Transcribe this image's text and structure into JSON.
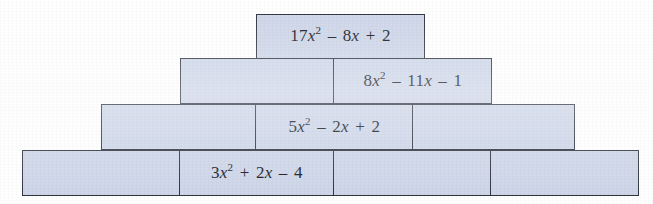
{
  "figure": {
    "name": "polynomial-brick-pyramid",
    "fill_color": "#ccd5e8",
    "border_color": "#2b2f3a",
    "background_color": "#ffffff"
  },
  "rows": [
    {
      "id": "row-1",
      "bricks": [
        {
          "id": "brick-1-1",
          "filled": true,
          "expr_html": "17<span class=\"var\">x</span><sup>2</sup><span class=\"op\"> – </span>8<span class=\"var\">x</span><span class=\"op\"> + </span>2",
          "expr_text": "17x2 – 8x + 2"
        }
      ]
    },
    {
      "id": "row-2",
      "bricks": [
        {
          "id": "brick-2-1",
          "filled": false,
          "expr_html": "",
          "expr_text": ""
        },
        {
          "id": "brick-2-2",
          "filled": true,
          "expr_html": "8<span class=\"var\">x</span><sup>2</sup><span class=\"op\"> – </span>11<span class=\"var\">x</span><span class=\"op\"> – </span>1",
          "expr_text": "8x2 – 11x – 1"
        }
      ]
    },
    {
      "id": "row-3",
      "bricks": [
        {
          "id": "brick-3-1",
          "filled": false,
          "expr_html": "",
          "expr_text": ""
        },
        {
          "id": "brick-3-2",
          "filled": true,
          "expr_html": "5<span class=\"var\">x</span><sup>2</sup><span class=\"op\"> – </span>2<span class=\"var\">x</span><span class=\"op\"> + </span>2",
          "expr_text": "5x2 – 2x + 2"
        },
        {
          "id": "brick-3-3",
          "filled": false,
          "expr_html": "",
          "expr_text": ""
        }
      ]
    },
    {
      "id": "row-4",
      "bricks": [
        {
          "id": "brick-4-1",
          "filled": false,
          "expr_html": "",
          "expr_text": ""
        },
        {
          "id": "brick-4-2",
          "filled": true,
          "expr_html": "3<span class=\"var\">x</span><sup>2</sup><span class=\"op\"> + </span>2<span class=\"var\">x</span><span class=\"op\"> – </span>4",
          "expr_text": "3x2 + 2x – 4"
        },
        {
          "id": "brick-4-3",
          "filled": false,
          "expr_html": "",
          "expr_text": ""
        },
        {
          "id": "brick-4-4",
          "filled": false,
          "expr_html": "",
          "expr_text": ""
        }
      ]
    }
  ],
  "geometry": {
    "rows": [
      {
        "left": 256,
        "top": 14,
        "height": 45,
        "widths": [
          169
        ]
      },
      {
        "left": 180,
        "top": 58,
        "height": 46,
        "widths": [
          155,
          159
        ]
      },
      {
        "left": 101,
        "top": 104,
        "height": 46,
        "widths": [
          156,
          158,
          163
        ]
      },
      {
        "left": 22,
        "top": 150,
        "height": 46,
        "widths": [
          159,
          155,
          159,
          149
        ]
      }
    ]
  }
}
